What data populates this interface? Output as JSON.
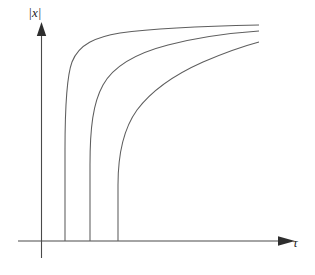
{
  "figure": {
    "title": "",
    "background_color": "#ffffff",
    "width": 315,
    "height": 275
  },
  "axes": {
    "y": {
      "label_bar_left": "|",
      "label_var": "x",
      "label_bar_right": "|",
      "label_full": "|x|",
      "name": "absolute value of x",
      "arrow": "up",
      "color": "#4a4a4a"
    },
    "x": {
      "label": "τ",
      "label_name": "tau",
      "arrow": "right",
      "color": "#4a4a4a"
    }
  },
  "chart_data": {
    "type": "line",
    "title": "",
    "xlabel": "τ",
    "ylabel": "|x|",
    "grid": false,
    "legend": false,
    "xlim": [
      0,
      1
    ],
    "ylim": [
      0,
      1
    ],
    "xticks": [],
    "yticks": [],
    "series": [
      {
        "name": "curve-1",
        "asymptote_x": 0.19,
        "plateau_y": 0.84,
        "color": "#5e5e5e",
        "path": "M 65 241 L 65 150 C 65 110 66 78 72 62 C 79 44 96 37 120 33 C 155 28 205 26 259 25",
        "points_x": [
          0.19,
          0.19,
          0.19,
          0.2,
          0.23,
          0.3,
          0.45,
          0.7,
          1.0
        ],
        "points_y": [
          0.0,
          0.34,
          0.49,
          0.62,
          0.73,
          0.79,
          0.82,
          0.835,
          0.84
        ]
      },
      {
        "name": "curve-2",
        "asymptote_x": 0.3,
        "plateau_y": 0.81,
        "color": "#5e5e5e",
        "path": "M 90 241 L 90 165 C 90 128 93 103 103 85 C 114 65 137 53 168 45 C 199 37 230 33 259 31",
        "points_x": [
          0.3,
          0.3,
          0.3,
          0.32,
          0.37,
          0.47,
          0.62,
          0.8,
          1.0
        ],
        "points_y": [
          0.0,
          0.28,
          0.42,
          0.55,
          0.65,
          0.72,
          0.765,
          0.79,
          0.81
        ]
      },
      {
        "name": "curve-3",
        "asymptote_x": 0.41,
        "plateau_y": 0.76,
        "color": "#5e5e5e",
        "path": "M 118 241 L 118 185 C 118 152 124 128 137 110 C 152 90 176 74 203 62 C 224 53 244 46 259 42",
        "points_x": [
          0.41,
          0.41,
          0.42,
          0.45,
          0.51,
          0.6,
          0.72,
          0.86,
          1.0
        ],
        "points_y": [
          0.0,
          0.22,
          0.35,
          0.47,
          0.57,
          0.645,
          0.695,
          0.73,
          0.76
        ]
      }
    ]
  }
}
